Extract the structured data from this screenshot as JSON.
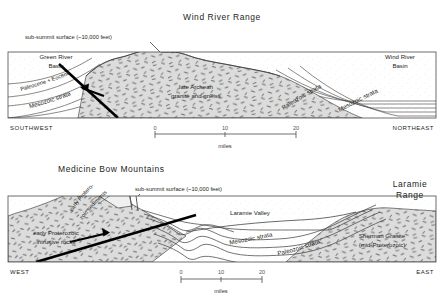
{
  "figure": {
    "type": "geologic-cross-section",
    "panel_count": 2
  },
  "panels": [
    {
      "id": "wind-river-range",
      "title": "Wind River Range",
      "annotation": "sub-summit surface (~10,000 feet)",
      "direction_left": "SOUTHWEST",
      "direction_right": "NORTHEAST",
      "units": [
        {
          "name": "Green River\nBasin",
          "line1": "Green River",
          "line2": "Basin"
        },
        {
          "name": "Paleocene + Eocene"
        },
        {
          "name": "Mesozoic  strata"
        },
        {
          "name": "late Archean",
          "line2": "granite and gneiss"
        },
        {
          "name": "Paleozoic strata"
        },
        {
          "name": "Mesozoic  strata"
        },
        {
          "name": "Wind River",
          "line2": "Basin"
        }
      ],
      "labels": {
        "green_river_basin_l1": "Green River",
        "green_river_basin_l2": "Basin",
        "paleocene_eocene": "Paleocene + Eocene",
        "mesozoic_left": "Mesozoic  strata",
        "archean_l1": "late Archean",
        "archean_l2": "granite and gneiss",
        "paleozoic_right": "Paleozoic  strata",
        "mesozoic_right": "Mesozoic  strata",
        "wind_river_basin_l1": "Wind River",
        "wind_river_basin_l2": "Basin"
      },
      "scalebar": {
        "ticks": [
          "0",
          "10",
          "20"
        ],
        "caption": "miles"
      }
    },
    {
      "id": "medicine-bow-mountains",
      "title": "Medicine Bow Mountains",
      "annotation": "sub-summit surface (~10,000 feet)",
      "direction_left": "WEST",
      "direction_right": "EAST",
      "labels": {
        "early_prot_sed_l1": "early Protero-",
        "early_prot_sed_l2": "zoic  sediments",
        "intrusive_l1": "early Proterozoic",
        "intrusive_l2": "intrusive rocks",
        "laramie_valley": "Laramie  Valley",
        "mesozoic": "Mesozoic   strata",
        "paleozoic": "Paleozoic   strata",
        "sherman_l1": "Sherman Granite",
        "sherman_l2": "(mid-Proterozoic)",
        "laramie_range_l1": "Laramie",
        "laramie_range_l2": "Range"
      },
      "scalebar": {
        "ticks": [
          "0",
          "10",
          "20"
        ],
        "caption": "miles"
      }
    }
  ],
  "colors": {
    "ink": "#231f20",
    "fault": "#000000",
    "basement_fill": "#d9d9d9",
    "sediment_fill": "#ffffff",
    "stipple": "#6f6f6f",
    "outline": "#4a4a4a",
    "scale": "#555555"
  }
}
